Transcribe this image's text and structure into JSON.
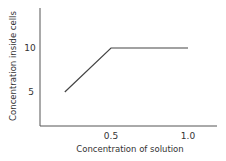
{
  "chart_data": {
    "type": "line",
    "title": "",
    "xlabel": "Concentration of solution",
    "ylabel": "Concentration inside cells",
    "x_ticks": [
      "0.5",
      "1.0"
    ],
    "y_ticks": [
      "5",
      "10"
    ],
    "series": [
      {
        "name": "Concentration inside cells",
        "x": [
          0.2,
          0.5,
          1.0
        ],
        "y": [
          5,
          10,
          10
        ]
      }
    ],
    "xlim": [
      0,
      1.15
    ],
    "ylim": [
      1.5,
      14.5
    ],
    "grid": false,
    "legend": null,
    "colors": {
      "line": "#444444",
      "axis": "#555555"
    }
  }
}
